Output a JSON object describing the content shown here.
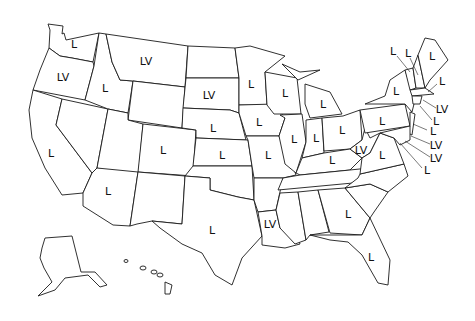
{
  "map": {
    "title": "United States state map with labels",
    "legend_codes": [
      "L",
      "LV"
    ],
    "labels": [
      {
        "state": "Washington",
        "code": "L",
        "x": 74,
        "y": 44
      },
      {
        "state": "Oregon",
        "code": "LV",
        "x": 63,
        "y": 77
      },
      {
        "state": "California",
        "code": "L",
        "x": 51,
        "y": 153
      },
      {
        "state": "Idaho",
        "code": "L",
        "x": 105,
        "y": 88
      },
      {
        "state": "Montana",
        "code": "LV",
        "x": 146,
        "y": 61
      },
      {
        "state": "South Dakota",
        "code": "LV",
        "x": 209,
        "y": 95
      },
      {
        "state": "Nebraska",
        "code": "L",
        "x": 213,
        "y": 128
      },
      {
        "state": "Colorado",
        "code": "L",
        "x": 163,
        "y": 150
      },
      {
        "state": "Kansas",
        "code": "L",
        "x": 222,
        "y": 155
      },
      {
        "state": "Arizona",
        "code": "L",
        "x": 108,
        "y": 191
      },
      {
        "state": "Texas",
        "code": "L",
        "x": 212,
        "y": 230
      },
      {
        "state": "Minnesota",
        "code": "L",
        "x": 251,
        "y": 84
      },
      {
        "state": "Wisconsin",
        "code": "L",
        "x": 285,
        "y": 93
      },
      {
        "state": "Michigan",
        "code": "L",
        "x": 323,
        "y": 104
      },
      {
        "state": "Iowa",
        "code": "L",
        "x": 259,
        "y": 122
      },
      {
        "state": "Illinois",
        "code": "L",
        "x": 294,
        "y": 139
      },
      {
        "state": "Indiana",
        "code": "L",
        "x": 316,
        "y": 138
      },
      {
        "state": "Ohio",
        "code": "L",
        "x": 342,
        "y": 130
      },
      {
        "state": "Missouri",
        "code": "L",
        "x": 268,
        "y": 155
      },
      {
        "state": "Kentucky",
        "code": "L",
        "x": 332,
        "y": 160
      },
      {
        "state": "West Virginia",
        "code": "LV",
        "x": 361,
        "y": 150
      },
      {
        "state": "Virginia",
        "code": "L",
        "x": 382,
        "y": 155
      },
      {
        "state": "Pennsylvania",
        "code": "L",
        "x": 382,
        "y": 121
      },
      {
        "state": "New York",
        "code": "L",
        "x": 396,
        "y": 91
      },
      {
        "state": "Louisiana",
        "code": "LV",
        "x": 270,
        "y": 224
      },
      {
        "state": "Georgia",
        "code": "L",
        "x": 348,
        "y": 214
      },
      {
        "state": "Florida",
        "code": "L",
        "x": 371,
        "y": 257
      },
      {
        "state": "Maine",
        "code": "L",
        "x": 432,
        "y": 56
      },
      {
        "state": "Vermont",
        "code": "L",
        "x": 393,
        "y": 51
      },
      {
        "state": "New Hampshire",
        "code": "L",
        "x": 408,
        "y": 53
      },
      {
        "state": "Massachusetts",
        "code": "L",
        "x": 442,
        "y": 81
      },
      {
        "state": "Rhode Island",
        "code": "LV",
        "x": 442,
        "y": 109
      },
      {
        "state": "Connecticut",
        "code": "L",
        "x": 436,
        "y": 121
      },
      {
        "state": "New Jersey",
        "code": "L",
        "x": 433,
        "y": 131
      },
      {
        "state": "Delaware",
        "code": "LV",
        "x": 436,
        "y": 145
      },
      {
        "state": "Maryland",
        "code": "LV",
        "x": 436,
        "y": 158
      },
      {
        "state": "DC",
        "code": "L",
        "x": 427,
        "y": 170
      }
    ]
  }
}
